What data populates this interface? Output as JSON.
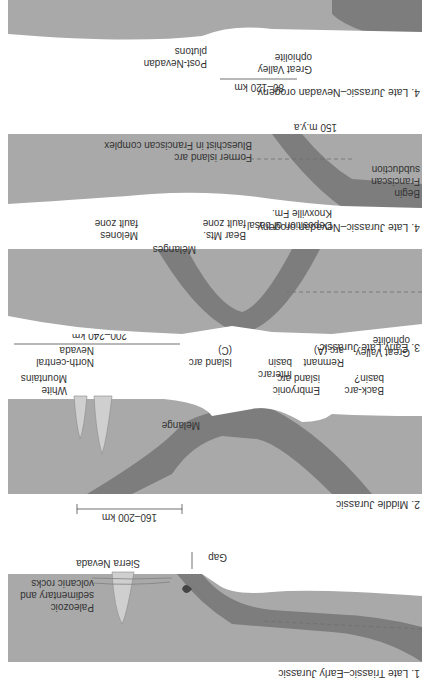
{
  "figure": {
    "orientation": "rotated 180 degrees",
    "colors": {
      "background": "#ffffff",
      "crust": "#a9a9a9",
      "slab": "#7d7d7d",
      "pluton": "#cfcfcf",
      "text": "#333333"
    },
    "panels": [
      {
        "title": "1. Late Triassic–Early Jurassic",
        "labels": {
          "sierra": "Sierra Nevada",
          "paleozoic_1": "Paleozoic",
          "paleozoic_2": "sedimentary and",
          "paleozoic_3": "volcanic rocks",
          "gap": "Gap"
        }
      },
      {
        "title": "2. Middle Jurassic",
        "scale": "160–200 km",
        "labels": {
          "white_1": "White",
          "white_2": "Mountains",
          "melange": "Melange",
          "embryonic_1": "Embryonic",
          "embryonic_2": "island arc",
          "backarc_1": "Back-arc",
          "backarc_2": "basin?"
        }
      },
      {
        "title": "3. Early Late Jurassic",
        "scale": "200–240 km",
        "labels": {
          "ncn_1": "North-central",
          "ncn_2": "Nevada",
          "islandarc_1": "Island arc",
          "islandarc_2": "(C)",
          "interarc_1": "Interarc",
          "interarc_2": "basin",
          "remnant_1": "Remnant",
          "remnant_2": "arc (A)",
          "gv_1": "Great Valley",
          "gv_2": "ophiolite"
        }
      },
      {
        "title": "4. Late Jurassic–Nevadan orogeny",
        "labels": {
          "melones_1": "Melones",
          "melones_2": "fault zone",
          "melanges": "Mélanges",
          "bearmts_1": "Bear Mts.",
          "bearmts_2": "fault zone",
          "knox_1": "Deposition of basal",
          "knox_2": "Knoxville Fm.",
          "begin_1": "Begin",
          "begin_2": "Franciscan",
          "begin_3": "subduction",
          "former": "Former island arc",
          "blueschist": "Blueschist in Franciscan complex",
          "mya": "150 m.y.a"
        }
      },
      {
        "title": "5. (top, partially visible)",
        "scale": "80–120 km",
        "labels": {
          "postnev_1": "Post-Nevadan",
          "postnev_2": "plutons",
          "gv_1": "Great Valley",
          "gv_2": "ophiolite"
        }
      }
    ]
  }
}
